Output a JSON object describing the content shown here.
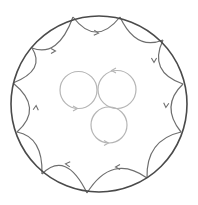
{
  "diagram": {
    "type": "vortex-boundary-diagram",
    "outer_circle": {
      "cx": 99,
      "cy": 104,
      "r": 88,
      "color": "#4a4a4a",
      "stroke_width": 1.6
    },
    "boundary_arc_color": "#6e6e6e",
    "inner_circle_color": "#b5b5b5",
    "cusps": [
      [
        73,
        17
      ],
      [
        120,
        17
      ],
      [
        163,
        40
      ],
      [
        183,
        84
      ],
      [
        181,
        132
      ],
      [
        147,
        178
      ],
      [
        87,
        193
      ],
      [
        42,
        174
      ],
      [
        17,
        132
      ],
      [
        13,
        83
      ],
      [
        32,
        48
      ]
    ],
    "boundary_arcs": [
      {
        "from": 10,
        "to": 0,
        "ctrl": [
          58,
          58
        ],
        "arrow": {
          "x": 54,
          "y": 51,
          "angle": 0
        }
      },
      {
        "from": 0,
        "to": 1,
        "ctrl": [
          96,
          47
        ],
        "arrow": {
          "x": 97,
          "y": 33,
          "angle": 5
        }
      },
      {
        "from": 1,
        "to": 2,
        "ctrl": [
          136,
          51
        ],
        "arrow": null
      },
      {
        "from": 2,
        "to": 3,
        "ctrl": [
          148,
          72
        ],
        "arrow": {
          "x": 154,
          "y": 61,
          "angle": 90
        }
      },
      {
        "from": 3,
        "to": 4,
        "ctrl": [
          160,
          106
        ],
        "arrow": {
          "x": 166,
          "y": 106,
          "angle": 95
        }
      },
      {
        "from": 4,
        "to": 5,
        "ctrl": [
          146,
          140
        ],
        "arrow": null
      },
      {
        "from": 5,
        "to": 6,
        "ctrl": [
          112,
          153
        ],
        "arrow": {
          "x": 117,
          "y": 167,
          "angle": 180
        }
      },
      {
        "from": 6,
        "to": 7,
        "ctrl": [
          66,
          150
        ],
        "arrow": {
          "x": 67,
          "y": 164,
          "angle": 185
        }
      },
      {
        "from": 7,
        "to": 8,
        "ctrl": [
          43,
          137
        ],
        "arrow": null
      },
      {
        "from": 8,
        "to": 9,
        "ctrl": [
          44,
          108
        ],
        "arrow": {
          "x": 36,
          "y": 107,
          "angle": -85
        }
      },
      {
        "from": 9,
        "to": 10,
        "ctrl": [
          46,
          70
        ],
        "arrow": null
      }
    ],
    "inner_circles": [
      {
        "name": "left",
        "cx": 78.5,
        "cy": 90,
        "r": 18.5,
        "arrow": {
          "x": 76,
          "y": 108.5,
          "angle": 0
        }
      },
      {
        "name": "right",
        "cx": 117,
        "cy": 89.5,
        "r": 19,
        "arrow": {
          "x": 113,
          "y": 70.5,
          "angle": 180
        }
      },
      {
        "name": "bottom",
        "cx": 109,
        "cy": 125,
        "r": 18,
        "arrow": {
          "x": 107,
          "y": 143,
          "angle": 0
        }
      }
    ]
  }
}
